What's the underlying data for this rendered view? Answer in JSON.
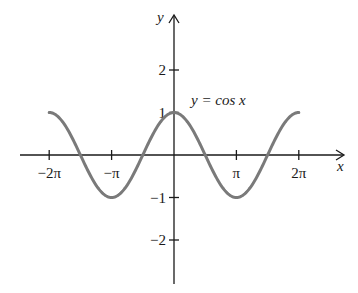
{
  "chart_data": {
    "type": "line",
    "title": "",
    "xlabel": "x",
    "ylabel": "y",
    "annotations": [
      {
        "text": "y = cos x",
        "x": 0.55,
        "y": 1.55
      }
    ],
    "x_ticks": [
      {
        "value": -6.2832,
        "label": "−2π"
      },
      {
        "value": -3.1416,
        "label": "−π"
      },
      {
        "value": 3.1416,
        "label": "π"
      },
      {
        "value": 6.2832,
        "label": "2π"
      }
    ],
    "y_ticks": [
      {
        "value": 2,
        "label": "2"
      },
      {
        "value": 1,
        "label": "1"
      },
      {
        "value": -1,
        "label": "−1"
      },
      {
        "value": -2,
        "label": "−2"
      }
    ],
    "xlim": [
      -7.1,
      9.5
    ],
    "ylim": [
      -3.0,
      3.3
    ],
    "grid": false,
    "legend": null,
    "series": [
      {
        "name": "y = cos x",
        "function": "cos(x)",
        "domain": [
          -6.2832,
          6.2832
        ],
        "color": "#7a7a7a",
        "x": [
          -6.2832,
          -4.7124,
          -3.1416,
          -1.5708,
          0,
          1.5708,
          3.1416,
          4.7124,
          6.2832
        ],
        "values": [
          1,
          0,
          -1,
          0,
          1,
          0,
          -1,
          0,
          1
        ]
      }
    ]
  },
  "labels": {
    "y_axis": "y",
    "x_axis": "x",
    "equation": "y = cos x"
  }
}
